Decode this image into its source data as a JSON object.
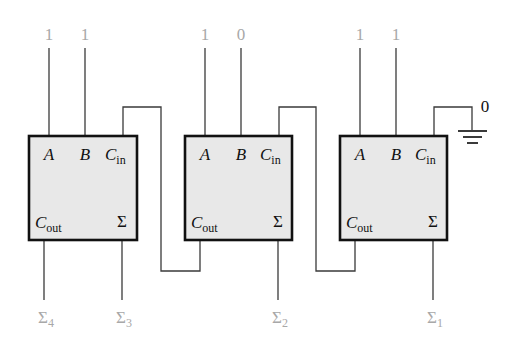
{
  "diagram": {
    "title": "",
    "adders": [
      {
        "id": "adder-4",
        "inputs": {
          "A": "1",
          "B": "1"
        },
        "pins": {
          "a": "A",
          "b": "B",
          "cin_main": "C",
          "cin_sub": "in",
          "cout_main": "C",
          "cout_sub": "out",
          "sum": "Σ"
        },
        "sum_output": {
          "main": "Σ",
          "sub": "4"
        },
        "sum3_output": {
          "main": "Σ",
          "sub": "3"
        }
      },
      {
        "id": "adder-2",
        "inputs": {
          "A": "1",
          "B": "0"
        },
        "pins": {
          "a": "A",
          "b": "B",
          "cin_main": "C",
          "cin_sub": "in",
          "cout_main": "C",
          "cout_sub": "out",
          "sum": "Σ"
        },
        "sum_output": {
          "main": "Σ",
          "sub": "2"
        }
      },
      {
        "id": "adder-1",
        "inputs": {
          "A": "1",
          "B": "1"
        },
        "pins": {
          "a": "A",
          "b": "B",
          "cin_main": "C",
          "cin_sub": "in",
          "cout_main": "C",
          "cout_sub": "out",
          "sum": "Σ"
        },
        "sum_output": {
          "main": "Σ",
          "sub": "1"
        }
      }
    ],
    "carry_in_value": "0",
    "ground_symbol": "ground-icon",
    "colors": {
      "box_fill": "#e8e8e8",
      "box_stroke": "#111111",
      "wire": "#3a3a3a",
      "io_label": "#a8a8a8"
    }
  }
}
